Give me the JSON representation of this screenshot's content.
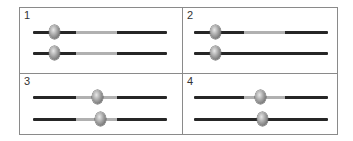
{
  "colors": {
    "border": "#8a8a8a",
    "track": "#262626",
    "highlight_segment": "#b0b0b0",
    "thumb": "#a0a0a0"
  },
  "panels": [
    {
      "label": "1",
      "sliders": [
        {
          "thumb_x": 53,
          "segment": [
            82,
            123
          ]
        },
        {
          "thumb_x": 53,
          "segment": [
            82,
            123
          ]
        }
      ]
    },
    {
      "label": "2",
      "sliders": [
        {
          "thumb_x": 214,
          "segment": [
            243,
            284
          ]
        },
        {
          "thumb_x": 214,
          "segment": null
        }
      ]
    },
    {
      "label": "3",
      "sliders": [
        {
          "thumb_x": 96,
          "segment": [
            82,
            123
          ]
        },
        {
          "thumb_x": 99,
          "segment": [
            82,
            123
          ]
        }
      ]
    },
    {
      "label": "4",
      "sliders": [
        {
          "thumb_x": 259,
          "segment": [
            243,
            284
          ]
        },
        {
          "thumb_x": 261,
          "segment": null
        }
      ]
    }
  ]
}
